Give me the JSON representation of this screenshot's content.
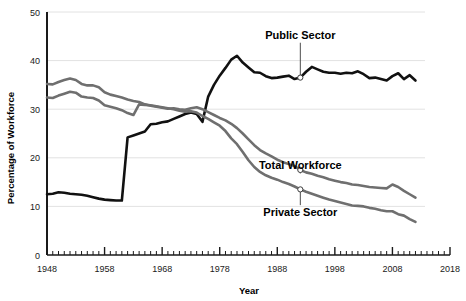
{
  "chart_data": {
    "type": "line",
    "title": "",
    "xlabel": "Year",
    "ylabel": "Percentage of Workforce",
    "xlim": [
      1948,
      2018
    ],
    "ylim": [
      0,
      50
    ],
    "grid": true,
    "legend_position": "inline-annotations",
    "yticks": [
      0,
      10,
      20,
      30,
      40,
      50
    ],
    "ytick_labels": [
      "0",
      "10",
      "20",
      "30",
      "40",
      "50"
    ],
    "xticks": [
      1948,
      1958,
      1968,
      1978,
      1988,
      1998,
      2008,
      2018
    ],
    "xtick_labels": [
      "1948",
      "1958",
      "1968",
      "1978",
      "1988",
      "1998",
      "2008",
      "2018"
    ],
    "minor_tick_interval": 1,
    "series": [
      {
        "name": "Public Sector",
        "color": "#111111",
        "label_x": 1988,
        "label_y": 44.5,
        "marker_year": 1992,
        "x": [
          1948,
          1949,
          1950,
          1951,
          1952,
          1953,
          1954,
          1955,
          1956,
          1957,
          1958,
          1959,
          1960,
          1961,
          1962,
          1963,
          1964,
          1965,
          1966,
          1967,
          1968,
          1969,
          1970,
          1971,
          1972,
          1973,
          1974,
          1975,
          1976,
          1977,
          1978,
          1979,
          1980,
          1981,
          1982,
          1983,
          1984,
          1985,
          1986,
          1987,
          1988,
          1989,
          1990,
          1991,
          1992,
          1993,
          1994,
          1995,
          1996,
          1997,
          1998,
          1999,
          2000,
          2001,
          2002,
          2003,
          2004,
          2005,
          2006,
          2007,
          2008,
          2009,
          2010,
          2011,
          2012
        ],
        "values": [
          12.5,
          12.6,
          12.9,
          12.8,
          12.6,
          12.5,
          12.4,
          12.2,
          11.9,
          11.6,
          11.4,
          11.3,
          11.2,
          11.2,
          24.2,
          24.6,
          25.0,
          25.4,
          26.9,
          27.0,
          27.3,
          27.5,
          28.0,
          28.5,
          29.0,
          29.3,
          29.0,
          27.4,
          32.6,
          35.0,
          36.9,
          38.5,
          40.2,
          41.0,
          39.6,
          38.6,
          37.6,
          37.5,
          36.8,
          36.4,
          36.5,
          36.7,
          36.9,
          36.2,
          36.5,
          37.7,
          38.7,
          38.2,
          37.7,
          37.5,
          37.5,
          37.3,
          37.5,
          37.4,
          37.8,
          37.2,
          36.4,
          36.5,
          36.2,
          35.9,
          36.8,
          37.4,
          36.2,
          37.0,
          35.9
        ]
      },
      {
        "name": "Total Workforce",
        "color": "#6f6f6f",
        "label_x": 1988,
        "label_y": 17.6,
        "marker_year": 1992,
        "x": [
          1948,
          1949,
          1950,
          1951,
          1952,
          1953,
          1954,
          1955,
          1956,
          1957,
          1958,
          1959,
          1960,
          1961,
          1962,
          1963,
          1964,
          1965,
          1966,
          1967,
          1968,
          1969,
          1970,
          1971,
          1972,
          1973,
          1974,
          1975,
          1976,
          1977,
          1978,
          1979,
          1980,
          1981,
          1982,
          1983,
          1984,
          1985,
          1986,
          1987,
          1988,
          1989,
          1990,
          1991,
          1992,
          1993,
          1994,
          1995,
          1996,
          1997,
          1998,
          1999,
          2000,
          2001,
          2002,
          2003,
          2004,
          2005,
          2006,
          2007,
          2008,
          2009,
          2010,
          2011,
          2012
        ],
        "values": [
          35.2,
          35.1,
          35.6,
          36.0,
          36.3,
          36.0,
          35.2,
          34.9,
          34.9,
          34.5,
          33.5,
          33.0,
          32.7,
          32.4,
          32.0,
          31.7,
          31.5,
          31.0,
          30.7,
          30.5,
          30.3,
          30.1,
          30.2,
          30.0,
          29.9,
          30.2,
          30.4,
          30.0,
          29.4,
          28.8,
          28.2,
          27.7,
          27.0,
          26.1,
          25.0,
          23.8,
          22.6,
          21.6,
          20.9,
          20.3,
          19.6,
          19.1,
          18.7,
          18.3,
          17.5,
          17.0,
          16.7,
          16.3,
          16.0,
          15.6,
          15.3,
          15.0,
          14.8,
          14.5,
          14.4,
          14.2,
          14.0,
          13.9,
          13.8,
          13.7,
          14.5,
          14.0,
          13.2,
          12.5,
          11.8
        ]
      },
      {
        "name": "Private Sector",
        "color": "#6f6f6f",
        "label_x": 1988,
        "label_y": 8.0,
        "marker_year": 1992,
        "x": [
          1948,
          1949,
          1950,
          1951,
          1952,
          1953,
          1954,
          1955,
          1956,
          1957,
          1958,
          1959,
          1960,
          1961,
          1962,
          1963,
          1964,
          1965,
          1966,
          1967,
          1968,
          1969,
          1970,
          1971,
          1972,
          1973,
          1974,
          1975,
          1976,
          1977,
          1978,
          1979,
          1980,
          1981,
          1982,
          1983,
          1984,
          1985,
          1986,
          1987,
          1988,
          1989,
          1990,
          1991,
          1992,
          1993,
          1994,
          1995,
          1996,
          1997,
          1998,
          1999,
          2000,
          2001,
          2002,
          2003,
          2004,
          2005,
          2006,
          2007,
          2008,
          2009,
          2010,
          2011,
          2012
        ],
        "values": [
          32.4,
          32.3,
          32.8,
          33.2,
          33.6,
          33.4,
          32.6,
          32.4,
          32.3,
          31.8,
          30.8,
          30.5,
          30.2,
          29.8,
          29.2,
          28.8,
          31.0,
          30.9,
          30.8,
          30.6,
          30.4,
          30.2,
          30.0,
          29.7,
          29.5,
          29.6,
          29.3,
          28.6,
          28.0,
          27.3,
          26.6,
          25.5,
          24.0,
          22.8,
          21.2,
          19.5,
          18.1,
          17.1,
          16.4,
          15.9,
          15.5,
          15.0,
          14.6,
          14.1,
          13.5,
          13.0,
          12.6,
          12.2,
          11.8,
          11.4,
          11.1,
          10.8,
          10.5,
          10.2,
          10.1,
          10.0,
          9.7,
          9.5,
          9.2,
          9.0,
          9.0,
          8.4,
          8.1,
          7.4,
          6.8
        ]
      }
    ]
  },
  "axes": {
    "y_title": "Percentage of Workforce",
    "x_title": "Year"
  },
  "colors": {
    "public": "#111111",
    "gray": "#6f6f6f",
    "grid": "#e2e2e2",
    "axis": "#1a1a1a",
    "background": "#ffffff"
  }
}
